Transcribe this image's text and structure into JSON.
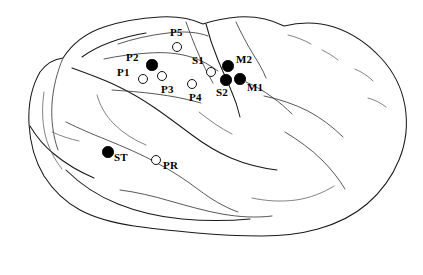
{
  "figure": {
    "type": "anatomical-diagram",
    "background_color": "#ffffff",
    "outline_color": "#1a1a1a",
    "filled_marker_color": "#000000",
    "open_marker_color": "#ffffff",
    "width": 423,
    "height": 275
  },
  "sites": [
    {
      "id": "P5",
      "label": "P5",
      "style": "open",
      "marker_x": 177,
      "marker_y": 47,
      "marker_r": 5.0,
      "label_x": 170,
      "label_y": 27
    },
    {
      "id": "P2",
      "label": "P2",
      "style": "filled",
      "marker_x": 152,
      "marker_y": 65,
      "marker_r": 5.6,
      "label_x": 126,
      "label_y": 52
    },
    {
      "id": "P1",
      "label": "P1",
      "style": "open",
      "marker_x": 143,
      "marker_y": 79,
      "marker_r": 5.0,
      "label_x": 117,
      "label_y": 67
    },
    {
      "id": "P3",
      "label": "P3",
      "style": "open",
      "marker_x": 162,
      "marker_y": 76,
      "marker_r": 5.0,
      "label_x": 161,
      "label_y": 84
    },
    {
      "id": "P4",
      "label": "P4",
      "style": "open",
      "marker_x": 192,
      "marker_y": 84,
      "marker_r": 5.0,
      "label_x": 189,
      "label_y": 92
    },
    {
      "id": "S1",
      "label": "S1",
      "style": "open",
      "marker_x": 211,
      "marker_y": 72,
      "marker_r": 5.0,
      "label_x": 192,
      "label_y": 55
    },
    {
      "id": "M2",
      "label": "M2",
      "style": "filled",
      "marker_x": 228,
      "marker_y": 66,
      "marker_r": 5.8,
      "label_x": 236,
      "label_y": 54
    },
    {
      "id": "S2",
      "label": "S2",
      "style": "filled",
      "marker_x": 226,
      "marker_y": 80,
      "marker_r": 5.8,
      "label_x": 216,
      "label_y": 87
    },
    {
      "id": "M1",
      "label": "M1",
      "style": "filled",
      "marker_x": 240,
      "marker_y": 79,
      "marker_r": 5.8,
      "label_x": 247,
      "label_y": 82
    },
    {
      "id": "ST",
      "label": "ST",
      "style": "filled",
      "marker_x": 108,
      "marker_y": 152,
      "marker_r": 5.8,
      "label_x": 114,
      "label_y": 152
    },
    {
      "id": "PR",
      "label": "PR",
      "style": "open",
      "marker_x": 156,
      "marker_y": 160,
      "marker_r": 5.0,
      "label_x": 163,
      "label_y": 160
    }
  ]
}
